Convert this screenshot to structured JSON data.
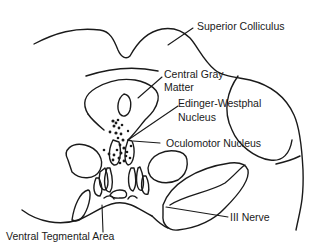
{
  "diagram": {
    "labels": {
      "superior_colliculus": "Superior Colliculus",
      "central_gray_line1": "Central Gray",
      "central_gray_line2": "Matter",
      "edinger_line1": "Edinger-Westphal",
      "edinger_line2": "Nucleus",
      "oculomotor": "Oculomotor Nucleus",
      "iii_nerve": "III Nerve",
      "vta": "Ventral Tegmental Area"
    },
    "colors": {
      "line": "#1a1a1a",
      "background": "#ffffff"
    }
  }
}
